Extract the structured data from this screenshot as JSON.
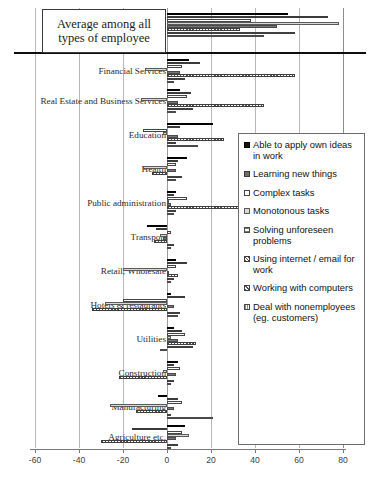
{
  "chart_data": {
    "type": "bar",
    "orientation": "horizontal",
    "title": "",
    "xlabel": "",
    "ylabel": "",
    "xlim": [
      -60,
      80
    ],
    "xticks": [
      -60,
      -40,
      -20,
      0,
      20,
      40,
      60,
      80
    ],
    "xticklabels": [
      "-60",
      "-40",
      "-20",
      "0",
      "20",
      "40",
      "60",
      "80"
    ],
    "grid": true,
    "legend_position": "right",
    "categories": [
      "Average among all types of employee",
      "Financial Services",
      "Real Estate and Business Services",
      "Education",
      "Health",
      "Public administration",
      "Transport",
      "Retail, Wholesale",
      "Hotels & restaurants",
      "Utilities",
      "Construction",
      "Manufacturing",
      "Agriculture etc."
    ],
    "series": [
      {
        "name": "Able to apply own ideas in work",
        "values": [
          55,
          10,
          6,
          21,
          9,
          4,
          -9,
          4,
          2,
          3,
          5,
          -4,
          8
        ]
      },
      {
        "name": "Learning new things",
        "values": [
          73,
          15,
          11,
          6,
          5,
          3,
          -5,
          9,
          8,
          7,
          3,
          5,
          -16
        ]
      },
      {
        "name": "Complex tasks",
        "values": [
          38,
          7,
          9,
          -11,
          4,
          9,
          2,
          4,
          -20,
          8,
          6,
          7,
          7
        ]
      },
      {
        "name": "Monotonous tasks",
        "values": [
          78,
          -10,
          -12,
          -2,
          -11,
          1,
          -3,
          -20,
          -28,
          2,
          -2,
          -26,
          10
        ]
      },
      {
        "name": "Solving unforeseen problems",
        "values": [
          50,
          6,
          5,
          5,
          4,
          2,
          -2,
          1,
          3,
          5,
          4,
          3,
          4
        ]
      },
      {
        "name": "Using internet / email for work",
        "values": [
          33,
          58,
          44,
          26,
          -7,
          38,
          -6,
          5,
          -34,
          13,
          -22,
          -14,
          -30
        ]
      },
      {
        "name": "Working with computers",
        "values": [
          58,
          8,
          12,
          4,
          7,
          4,
          3,
          3,
          6,
          12,
          3,
          2,
          5
        ]
      },
      {
        "name": "Deal with nonemployees (eg. customers)",
        "values": [
          44,
          3,
          4,
          14,
          4,
          3,
          2,
          2,
          5,
          -3,
          2,
          21,
          2
        ]
      }
    ]
  },
  "avg_box": {
    "line1": "Average among all",
    "line2": "types of employee"
  },
  "legend": {
    "items": [
      {
        "label": "Able to apply own ideas in work",
        "series": 0
      },
      {
        "label": "Learning new things",
        "series": 1
      },
      {
        "label": "Complex tasks",
        "series": 2
      },
      {
        "label": "Monotonous tasks",
        "series": 3
      },
      {
        "label": "Solving unforeseen problems",
        "series": 4
      },
      {
        "label": "Using internet / email for work",
        "series": 5
      },
      {
        "label": "Working with computers",
        "series": 6
      },
      {
        "label": "Deal with nonemployees (eg. customers)",
        "series": 7
      }
    ]
  },
  "colors": {
    "series0": "#121212",
    "series1": "#6e6e6e",
    "series2": "#ffffff",
    "series3": "#d8d8d8",
    "gridline": "#b9b9b9",
    "axis": "#7a7a7a",
    "separator": "#0d0d0d"
  }
}
